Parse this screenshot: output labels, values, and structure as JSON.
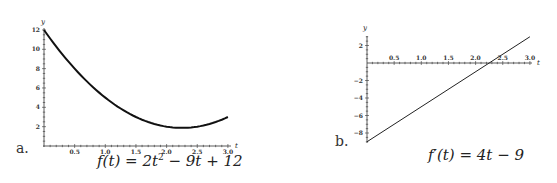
{
  "chart_data": [
    {
      "type": "line",
      "panel_label": "a.",
      "title": "f(t) = 2t^2 - 9t + 12",
      "formula": {
        "lhs": "f(t) = 2t",
        "exp": "2",
        "rhs": " − 9t + 12"
      },
      "xlabel": "t",
      "ylabel": "y",
      "xlim": [
        0,
        3.0
      ],
      "ylim": [
        0,
        12
      ],
      "x_ticks": [
        "0.5",
        "1.0",
        "1.5",
        "2.0",
        "2.5",
        "3.0"
      ],
      "y_ticks": [
        "2",
        "4",
        "6",
        "8",
        "10",
        "12"
      ],
      "grid": false,
      "series": [
        {
          "name": "f(t)",
          "x": [
            0,
            0.25,
            0.5,
            0.75,
            1.0,
            1.25,
            1.5,
            1.75,
            2.0,
            2.25,
            2.5,
            2.75,
            3.0
          ],
          "values": [
            12,
            9.875,
            8.0,
            6.375,
            5.0,
            3.875,
            3.0,
            2.375,
            2.0,
            1.875,
            2.0,
            2.375,
            3.0
          ]
        }
      ]
    },
    {
      "type": "line",
      "panel_label": "b.",
      "title": "f'(t) = 4t - 9",
      "formula": {
        "lhs": "f′(t) = 4t − 9"
      },
      "xlabel": "t",
      "ylabel": "y",
      "xlim": [
        0,
        3.0
      ],
      "ylim": [
        -9,
        3
      ],
      "x_ticks": [
        "0.5",
        "1.0",
        "1.5",
        "2.0",
        "2.5",
        "3.0"
      ],
      "y_ticks": [
        "2",
        "−2",
        "−4",
        "−6",
        "−8"
      ],
      "grid": false,
      "series": [
        {
          "name": "f'(t)",
          "x": [
            0,
            3.0
          ],
          "values": [
            -9,
            3
          ]
        }
      ]
    }
  ]
}
